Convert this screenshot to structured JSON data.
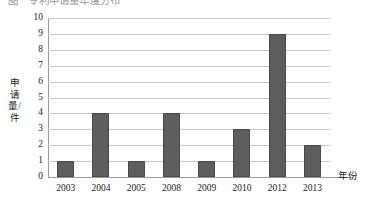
{
  "caption": {
    "clipped_text": "图　专利申请量年度分布"
  },
  "chart_data": {
    "type": "bar",
    "title": "",
    "categories": [
      "2003",
      "2004",
      "2005",
      "2008",
      "2009",
      "2010",
      "2012",
      "2013"
    ],
    "values": [
      1,
      4,
      1,
      4,
      1,
      3,
      9,
      2
    ],
    "xlabel": "年份",
    "ylabel": "申请量/件",
    "ylim": [
      0,
      10
    ],
    "yticks": [
      "0",
      "1",
      "2",
      "3",
      "4",
      "5",
      "6",
      "7",
      "8",
      "9",
      "10"
    ],
    "grid": true,
    "legend": "none",
    "bar_color": "#5d5d5d",
    "grid_color": "#c9c9c9",
    "axis_color": "#9a9a9a",
    "background": "#ffffff"
  }
}
